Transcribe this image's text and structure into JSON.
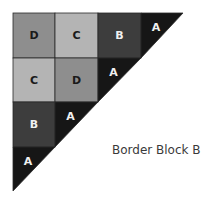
{
  "caption": "Border Block B",
  "colors": {
    "A": "#161616",
    "B": "#3d3d3d",
    "C": "#b4b4b4",
    "D": "#8e8e8e",
    "border": "#2a2a2a",
    "dark_text": "#1a1a1a",
    "light_text": "#f0f0f0"
  },
  "grid": {
    "rows": [
      [
        "D",
        "C",
        "B",
        "A"
      ],
      [
        "C",
        "D",
        "A"
      ],
      [
        "B",
        "A"
      ],
      [
        "A"
      ]
    ]
  }
}
